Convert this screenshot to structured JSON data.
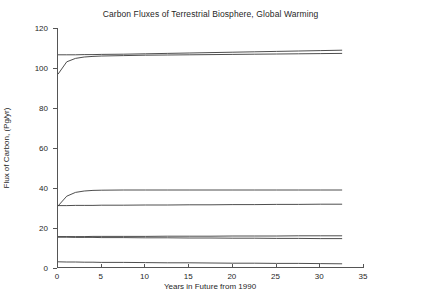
{
  "chart_data": {
    "type": "line",
    "title": "Carbon Fluxes of Terrestrial Biosphere, Global Warming",
    "xlabel": "Years in Future from 1990",
    "ylabel": "Flux of Carbon, (Pg/yr)",
    "xlim": [
      0,
      35
    ],
    "ylim": [
      0,
      120
    ],
    "xticks": [
      0,
      5,
      10,
      15,
      20,
      25,
      30,
      35
    ],
    "yticks": [
      0,
      20,
      40,
      60,
      80,
      100,
      120
    ],
    "grid": false,
    "legend": "none",
    "line_color": "#3a3a3a",
    "x": [
      0,
      1,
      2,
      3,
      4,
      5,
      7.5,
      10,
      12.5,
      15,
      17.5,
      20,
      22.5,
      25,
      27.5,
      30,
      32.5
    ],
    "series": [
      {
        "name": "Gross primary production",
        "values": [
          106.6,
          106.6,
          106.6,
          106.7,
          106.7,
          106.8,
          106.9,
          107.1,
          107.3,
          107.5,
          107.7,
          107.9,
          108.1,
          108.3,
          108.5,
          108.7,
          108.9
        ]
      },
      {
        "name": "Total respiration",
        "values": [
          96.9,
          103.1,
          104.8,
          105.5,
          105.8,
          106.0,
          106.2,
          106.4,
          106.5,
          106.6,
          106.7,
          106.8,
          106.9,
          107.0,
          107.1,
          107.2,
          107.3
        ]
      },
      {
        "name": "Heterotrophic respiration",
        "values": [
          31.0,
          35.9,
          37.8,
          38.5,
          38.8,
          38.9,
          39.0,
          39.0,
          39.0,
          39.0,
          39.0,
          39.0,
          39.0,
          39.0,
          39.0,
          39.0,
          39.0
        ]
      },
      {
        "name": "Net primary production",
        "values": [
          31.2,
          31.2,
          31.3,
          31.3,
          31.3,
          31.4,
          31.4,
          31.5,
          31.5,
          31.6,
          31.6,
          31.7,
          31.7,
          31.8,
          31.8,
          31.9,
          31.9
        ]
      },
      {
        "name": "Litter flux",
        "values": [
          15.7,
          15.7,
          15.7,
          15.7,
          15.8,
          15.8,
          15.8,
          15.8,
          15.9,
          15.9,
          15.9,
          16.0,
          16.0,
          16.0,
          16.1,
          16.1,
          16.1
        ]
      },
      {
        "name": "Soil carbon flux",
        "values": [
          15.4,
          15.4,
          15.3,
          15.3,
          15.3,
          15.2,
          15.2,
          15.1,
          15.1,
          15.0,
          15.0,
          14.9,
          14.9,
          14.8,
          14.8,
          14.7,
          14.7
        ]
      },
      {
        "name": "Net ecosystem exchange",
        "values": [
          3.1,
          3.0,
          3.0,
          2.9,
          2.9,
          2.8,
          2.8,
          2.7,
          2.6,
          2.6,
          2.5,
          2.4,
          2.4,
          2.3,
          2.3,
          2.2,
          2.1
        ]
      }
    ]
  }
}
